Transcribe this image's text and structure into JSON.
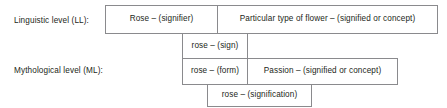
{
  "diagram": {
    "type": "two-level-semiotic-table",
    "rows": [
      {
        "label": "Linguistic level (LL):",
        "cells": [
          {
            "text": "Rose – (signifier)"
          },
          {
            "text": "Particular type of flower – (signified or concept)"
          }
        ]
      },
      {
        "label": "",
        "cells": [
          {
            "text": "rose – (sign)"
          }
        ]
      },
      {
        "label": "Mythological level (ML):",
        "cells": [
          {
            "text": "rose – (form)"
          },
          {
            "text": "Passion – (signified or concept)"
          }
        ]
      },
      {
        "label": "",
        "cells": [
          {
            "text": "rose – (signification)"
          }
        ]
      }
    ],
    "colors": {
      "text": "#231f20",
      "border": "#8a8a8d",
      "background": "#ffffff"
    }
  }
}
